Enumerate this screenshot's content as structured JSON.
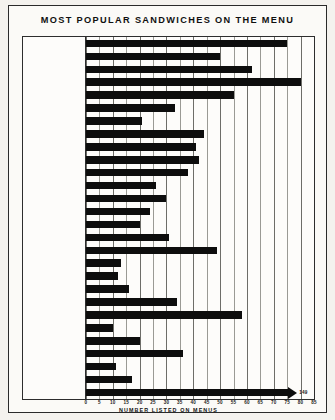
{
  "title": "MOST POPULAR SANDWICHES ON THE MENU",
  "axis": {
    "xlabel": "NUMBER LISTED ON MENUS",
    "ticks": [
      "0",
      "5",
      "10",
      "15",
      "20",
      "25",
      "30",
      "35",
      "40",
      "45",
      "50",
      "55",
      "60",
      "65",
      "70",
      "75",
      "80",
      "85"
    ],
    "xmin": 0,
    "xmax": 85
  },
  "colors": {
    "bar": "#0d0d0d",
    "grid": "#9a9a94",
    "frame": "#2d2d2d",
    "paper": "#fbfaf7"
  },
  "chart_data": {
    "type": "bar",
    "orientation": "horizontal",
    "title": "MOST POPULAR SANDWICHES ON THE MENU",
    "xlabel": "NUMBER LISTED ON MENUS",
    "ylabel": "",
    "xlim": [
      0,
      85
    ],
    "grid": true,
    "legend": null,
    "categories": [
      "HAMBURGER",
      "CHEESEBURGER",
      "STEAK SANDWICH",
      "HAM",
      "HAM & CHEESE",
      "CHICKEN",
      "CHICKEN SALAD",
      "TURKEY",
      "CORNED BEEF",
      "GRILLED CHEESE",
      "BACON, LETTUCE,\nTOMATO",
      "BARBEQUE BEEF",
      "FISH SANDWICH",
      "HAM & EGG",
      "DENVER",
      "EGG SANDWICH",
      "ROAST BEEF",
      "ROAST PORK",
      "SHRIMP",
      "SALAMI",
      "CLUB",
      "CHEESE",
      "BACON, CHEESE",
      "BACON, EGG",
      "TUNA FISH",
      "LETTUCE, TOMATO",
      "BACON, TOMATO",
      "OTHER"
    ],
    "values": [
      75,
      50,
      62,
      80,
      55,
      33,
      21,
      44,
      41,
      42,
      38,
      26,
      30,
      24,
      20,
      31,
      49,
      13,
      12,
      16,
      34,
      58,
      10,
      20,
      36,
      11,
      17,
      78
    ],
    "value_labels": [
      "",
      "",
      "",
      "",
      "",
      "",
      "",
      "",
      "",
      "",
      "",
      "",
      "",
      "",
      "",
      "",
      "",
      "",
      "",
      "",
      "",
      "",
      "",
      "",
      "",
      "",
      "",
      "149"
    ],
    "truncated_bars": [
      "OTHER"
    ]
  }
}
